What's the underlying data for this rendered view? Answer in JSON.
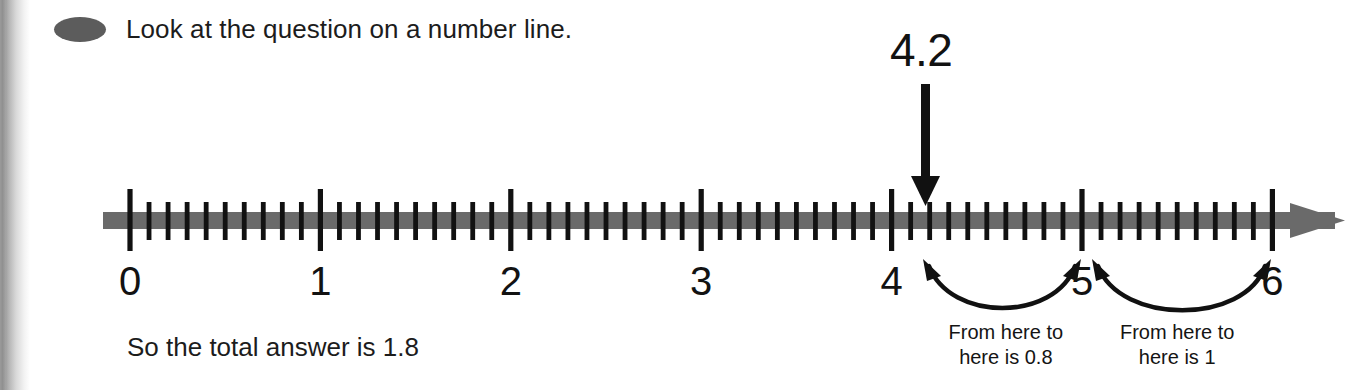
{
  "page": {
    "width": 1371,
    "height": 390,
    "background": "#ffffff",
    "ink_color": "#121212",
    "line_color": "#6a6a6a",
    "bullet_color": "#5c5c5c"
  },
  "header": {
    "bullet_icon": "filled-ellipse-bullet",
    "text": "Look at the question on a number line."
  },
  "callout": {
    "value_label": "4.2",
    "pointer_icon": "down-arrow",
    "points_to_value": 4.2
  },
  "conclusion": {
    "text": "So the total answer is 1.8"
  },
  "annotations": [
    {
      "name": "span-4.2-to-5",
      "from_value": 4.2,
      "to_value": 5,
      "caption_line1": "From here to",
      "caption_line2": "here is 0.8",
      "amount": "0.8",
      "arrow_style": "double-headed-arc"
    },
    {
      "name": "span-5-to-6",
      "from_value": 5,
      "to_value": 6,
      "caption_line1": "From here to",
      "caption_line2": "here is 1",
      "amount": "1",
      "arrow_style": "double-headed-arc"
    }
  ],
  "chart_data": {
    "type": "number-line",
    "title": "Look at the question on a number line.",
    "xlabel": "",
    "ylabel": "",
    "xlim": [
      0,
      6
    ],
    "grid": false,
    "legend": "none",
    "axis_start_value": 0,
    "axis_end_value": 6,
    "major_tick_interval": 1,
    "minor_ticks_per_interval": 10,
    "minor_tick_interval": 0.1,
    "tick_labels": [
      "0",
      "1",
      "2",
      "3",
      "4",
      "5",
      "6"
    ],
    "tick_values": [
      0,
      1,
      2,
      3,
      4,
      5,
      6
    ],
    "has_right_arrowhead": true,
    "markers": [
      {
        "label": "4.2",
        "value": 4.2,
        "style": "down-arrow"
      }
    ],
    "spans": [
      {
        "from": 4.2,
        "to": 5,
        "label": "From here to here is 0.8",
        "value": 0.8
      },
      {
        "from": 5,
        "to": 6,
        "label": "From here to here is 1",
        "value": 1
      }
    ],
    "annotation_text": "So the total answer is 1.8",
    "total": 1.8,
    "geometry": {
      "origin_x_px": 130,
      "pixels_per_unit": 190.4,
      "baseline_y_px": 220
    }
  }
}
